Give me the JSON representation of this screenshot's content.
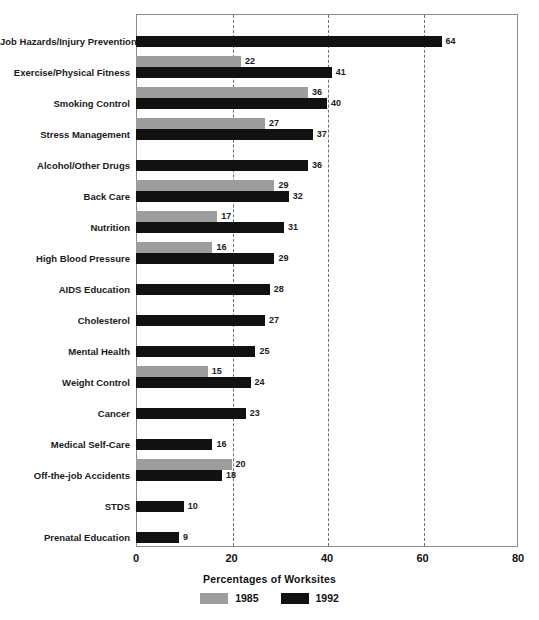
{
  "chart_data": {
    "type": "bar",
    "orientation": "horizontal",
    "title": "",
    "xlabel": "Percentages of Worksites",
    "ylabel": "",
    "xlim": [
      0,
      80
    ],
    "xticks": [
      0,
      20,
      40,
      60,
      80
    ],
    "grid": "vertical dashed gridlines at 20, 40, 60",
    "legend_position": "bottom-center",
    "categories": [
      "Job Hazards/Injury Prevention",
      "Exercise/Physical Fitness",
      "Smoking Control",
      "Stress Management",
      "Alcohol/Other Drugs",
      "Back Care",
      "Nutrition",
      "High Blood Pressure",
      "AIDS Education",
      "Cholesterol",
      "Mental Health",
      "Weight Control",
      "Cancer",
      "Medical Self-Care",
      "Off-the-job Accidents",
      "STDS",
      "Prenatal Education"
    ],
    "series": [
      {
        "name": "1985",
        "color": "#9d9d9d",
        "values": [
          null,
          22,
          36,
          27,
          null,
          29,
          17,
          16,
          null,
          null,
          null,
          15,
          null,
          null,
          20,
          null,
          null
        ]
      },
      {
        "name": "1992",
        "color": "#111111",
        "values": [
          64,
          41,
          40,
          37,
          36,
          32,
          31,
          29,
          28,
          27,
          25,
          24,
          23,
          16,
          18,
          10,
          9
        ]
      }
    ]
  },
  "legend": {
    "items": [
      {
        "label": "1985",
        "color": "#9d9d9d"
      },
      {
        "label": "1992",
        "color": "#111111"
      }
    ]
  },
  "axis": {
    "x_title": "Percentages of Worksites",
    "ticks": [
      "0",
      "20",
      "40",
      "60",
      "80"
    ]
  },
  "footnote": ""
}
